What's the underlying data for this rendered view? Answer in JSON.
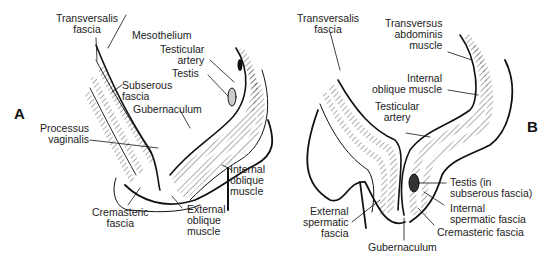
{
  "figure": {
    "panels": [
      {
        "id": "A",
        "label": "A",
        "annotations": {
          "transversalis_fascia": [
            "Transversalis",
            "fascia"
          ],
          "mesothelium": [
            "Mesothelium"
          ],
          "testicular_artery": [
            "Testicular",
            "artery"
          ],
          "testis": [
            "Testis"
          ],
          "subserous_fascia": [
            "Subserous",
            "fascia"
          ],
          "gubernaculum": [
            "Gubernaculum"
          ],
          "processus_vaginalis": [
            "Processus",
            "vaginalis"
          ],
          "internal_oblique_muscle": [
            "Internal",
            "oblique",
            "muscle"
          ],
          "cremasteric_fascia": [
            "Cremasteric",
            "fascia"
          ],
          "external_oblique_muscle": [
            "External",
            "oblique",
            "muscle"
          ]
        }
      },
      {
        "id": "B",
        "label": "B",
        "annotations": {
          "transversalis_fascia": [
            "Transversalis",
            "fascia"
          ],
          "transversus_abdominis_muscle": [
            "Transversus",
            "abdominis",
            "muscle"
          ],
          "internal_oblique_muscle": [
            "Internal",
            "oblique muscle"
          ],
          "testicular_artery": [
            "Testicular",
            "artery"
          ],
          "testis": [
            "Testis (in",
            "subserous fascia)"
          ],
          "internal_spermatic_fascia": [
            "Internal",
            "spermatic fascia"
          ],
          "cremasteric_fascia": [
            "Cremasteric fascia"
          ],
          "external_spermatic_fascia": [
            "External",
            "spermatic",
            "fascia"
          ],
          "gubernaculum": [
            "Gubernaculum"
          ]
        }
      }
    ]
  }
}
